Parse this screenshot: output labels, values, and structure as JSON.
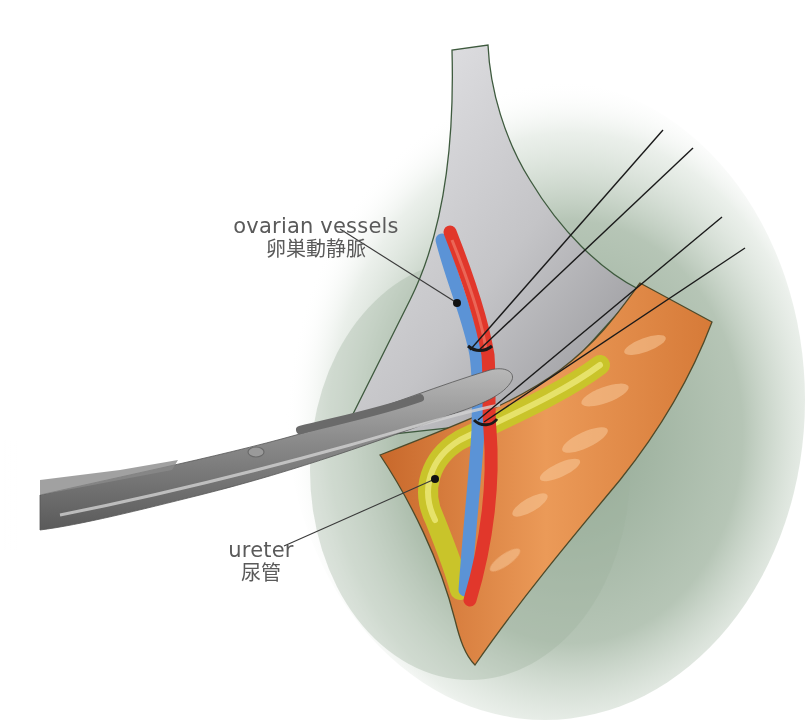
{
  "figure": {
    "type": "surgical-illustration",
    "colors": {
      "background": "#ffffff",
      "peritoneum_green": "#9fb29f",
      "ovary_membrane_gray": "#c9c9cb",
      "retroperitoneum_orange": "#e08a45",
      "artery_red": "#e1372b",
      "vein_blue": "#5b93d6",
      "ureter_yellow": "#d6d23a",
      "instrument_gray": "#7d7d7d",
      "suture_black": "#1a1a1a",
      "label_text": "#5a5a5a"
    }
  },
  "labels": {
    "ovarian_vessels": {
      "en": "ovarian vessels",
      "jp": "卵巣動静脈"
    },
    "ureter": {
      "en": "ureter",
      "jp": "尿管"
    }
  },
  "elements": [
    "peritoneal-field",
    "ovarian-suspensory-ligament",
    "retroperitoneal-tissue",
    "ovarian-artery",
    "ovarian-vein",
    "ureter",
    "surgical-scissors",
    "ligature-upper",
    "ligature-lower"
  ]
}
